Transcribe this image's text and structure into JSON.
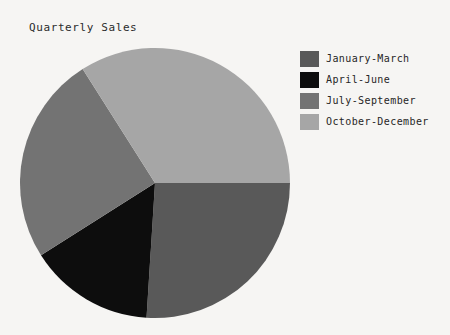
{
  "figure": {
    "cutoff_header_text": "· ·  ·· ·· ··",
    "title": "Quarterly Sales",
    "background_color": "#f6f5f3"
  },
  "legend": {
    "position": "right",
    "entries": [
      {
        "label": "January-March",
        "color": "#595959"
      },
      {
        "label": "April-June",
        "color": "#0d0d0d"
      },
      {
        "label": "July-September",
        "color": "#737373"
      },
      {
        "label": "October-December",
        "color": "#a6a6a6"
      }
    ]
  },
  "chart_data": {
    "type": "pie",
    "title": "Quarterly Sales",
    "xlabel": "",
    "ylabel": "",
    "labels": [
      "January-March",
      "April-June",
      "July-September",
      "October-December"
    ],
    "values": [
      26,
      15,
      25,
      34
    ],
    "percentages": [
      "26%",
      "15%",
      "25%",
      "34%"
    ],
    "colors": [
      "#595959",
      "#0d0d0d",
      "#737373",
      "#a6a6a6"
    ],
    "start_angle_deg": 0,
    "direction": "clockwise",
    "slice_angles_deg": [
      94,
      55,
      89,
      122
    ],
    "center_px": [
      155,
      183
    ],
    "radius_px": 135,
    "show_labels": false,
    "show_percent_labels": false,
    "legend_position": "right",
    "grid": false
  }
}
